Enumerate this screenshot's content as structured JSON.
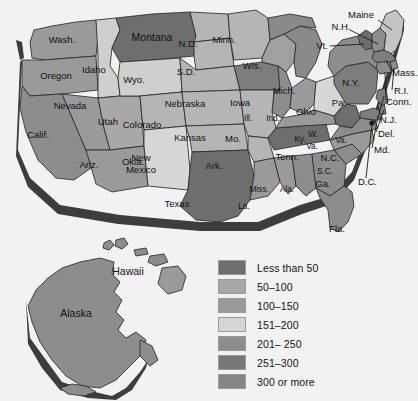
{
  "map": {
    "title": "United States choropleth map",
    "background_color": "#f2f2f2",
    "ocean_color": "#fafafa",
    "border_color": "#2b2b2b",
    "extrusion_color": "#3d3d3d"
  },
  "legend": {
    "entries": [
      {
        "label": "Less than 50",
        "color": "#6e6e6e"
      },
      {
        "label": "50–100",
        "color": "#a8a8a8"
      },
      {
        "label": "100–150",
        "color": "#9a9a9a"
      },
      {
        "label": "151–200",
        "color": "#d6d6d6"
      },
      {
        "label": "201– 250",
        "color": "#8d8d8d"
      },
      {
        "label": "251–300",
        "color": "#777777"
      },
      {
        "label": "300 or more",
        "color": "#858585"
      }
    ]
  },
  "states": [
    {
      "id": "wash",
      "label": "Wash.",
      "color": "#9a9a9a"
    },
    {
      "id": "oregon",
      "label": "Oregon",
      "color": "#9a9a9a"
    },
    {
      "id": "idaho",
      "label": "Idaho",
      "color": "#cfcfcf"
    },
    {
      "id": "mont",
      "label": "Montana",
      "color": "#6e6e6e"
    },
    {
      "id": "nd",
      "label": "N.D.",
      "color": "#b5b5b5"
    },
    {
      "id": "minn",
      "label": "Minn.",
      "color": "#b5b5b5"
    },
    {
      "id": "wis",
      "label": "Wis.",
      "color": "#a0a0a0"
    },
    {
      "id": "mich",
      "label": "Mich.",
      "color": "#8a8a8a"
    },
    {
      "id": "nevada",
      "label": "Nevada",
      "color": "#9a9a9a"
    },
    {
      "id": "calif",
      "label": "Calif.",
      "color": "#8d8d8d"
    },
    {
      "id": "utah",
      "label": "Utah",
      "color": "#a8a8a8"
    },
    {
      "id": "wyo",
      "label": "Wyo.",
      "color": "#cfcfcf"
    },
    {
      "id": "sd",
      "label": "S.D.",
      "color": "#b5b5b5"
    },
    {
      "id": "nebr",
      "label": "Nebraska",
      "color": "#b5b5b5"
    },
    {
      "id": "iowa",
      "label": "Iowa",
      "color": "#7d7d7d"
    },
    {
      "id": "ill",
      "label": "Ill.",
      "color": "#8d8d8d"
    },
    {
      "id": "ind",
      "label": "Ind.",
      "color": "#9a9a9a"
    },
    {
      "id": "ohio",
      "label": "Ohio",
      "color": "#d6d6d6"
    },
    {
      "id": "colo",
      "label": "Colorado",
      "color": "#b5b5b5"
    },
    {
      "id": "kans",
      "label": "Kansas",
      "color": "#b5b5b5"
    },
    {
      "id": "mo",
      "label": "Mo.",
      "color": "#b5b5b5"
    },
    {
      "id": "ariz",
      "label": "Ariz.",
      "color": "#9a9a9a"
    },
    {
      "id": "nmex",
      "label": "New\nMexico",
      "color": "#d6d6d6"
    },
    {
      "id": "okla",
      "label": "Okla.",
      "color": "#b5b5b5"
    },
    {
      "id": "ark",
      "label": "Ark.",
      "color": "#b5b5b5"
    },
    {
      "id": "texas",
      "label": "Texas",
      "color": "#6e6e6e"
    },
    {
      "id": "la",
      "label": "La.",
      "color": "#9a9a9a"
    },
    {
      "id": "miss",
      "label": "Miss.",
      "color": "#9a9a9a"
    },
    {
      "id": "ala",
      "label": "Ala.",
      "color": "#8d8d8d"
    },
    {
      "id": "tenn",
      "label": "Tenn.",
      "color": "#6e6e6e"
    },
    {
      "id": "ky",
      "label": "Ky.",
      "color": "#9a9a9a"
    },
    {
      "id": "ga",
      "label": "Ga.",
      "color": "#8d8d8d"
    },
    {
      "id": "fla",
      "label": "Fla.",
      "color": "#8d8d8d"
    },
    {
      "id": "sc",
      "label": "S.C.",
      "color": "#8d8d8d"
    },
    {
      "id": "nc",
      "label": "N.C.",
      "color": "#9a9a9a"
    },
    {
      "id": "wva",
      "label": "W.\nVa.",
      "color": "#6e6e6e"
    },
    {
      "id": "va",
      "label": "Va.",
      "color": "#8d8d8d"
    },
    {
      "id": "pa",
      "label": "Pa.",
      "color": "#7d7d7d"
    },
    {
      "id": "ny",
      "label": "N.Y.",
      "color": "#8d8d8d"
    },
    {
      "id": "vt",
      "label": "Vt.",
      "color": "#6e6e6e"
    },
    {
      "id": "nh",
      "label": "N.H.",
      "color": "#8d8d8d"
    },
    {
      "id": "maine",
      "label": "Maine",
      "color": "#c4c4c4"
    },
    {
      "id": "mass",
      "label": "Mass.",
      "color": "#7d7d7d"
    },
    {
      "id": "ri",
      "label": "R.I.",
      "color": "#8d8d8d"
    },
    {
      "id": "conn",
      "label": "Conn.",
      "color": "#8d8d8d"
    },
    {
      "id": "nj",
      "label": "N.J.",
      "color": "#7d7d7d"
    },
    {
      "id": "del",
      "label": "Del.",
      "color": "#7d7d7d"
    },
    {
      "id": "md",
      "label": "Md.",
      "color": "#7d7d7d"
    },
    {
      "id": "dc",
      "label": "D.C.",
      "color": "#1a1a1a"
    },
    {
      "id": "alaska",
      "label": "Alaska",
      "color": "#8d8d8d"
    },
    {
      "id": "hawaii",
      "label": "Hawaii",
      "color": "#8d8d8d"
    }
  ]
}
